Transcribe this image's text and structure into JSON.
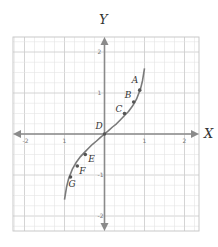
{
  "chart_data": {
    "type": "line",
    "title": "",
    "xlabel": "X",
    "ylabel": "Y",
    "xlim": [
      -2.3,
      2.3
    ],
    "ylim": [
      -2.4,
      2.4
    ],
    "grid": true,
    "grid_minor_step": 0.25,
    "x_ticks": [
      -2,
      -1,
      1,
      2
    ],
    "x_tick_labels": [
      "-2",
      "1",
      "1",
      "2"
    ],
    "y_ticks": [
      2,
      1,
      -1,
      -2
    ],
    "y_tick_labels": [
      "2",
      "1",
      "-1",
      "-2"
    ],
    "curve": {
      "description": "S-shaped increasing curve through origin",
      "x": [
        -1.0,
        -0.95,
        -0.9,
        -0.8,
        -0.7,
        -0.6,
        -0.5,
        -0.4,
        -0.3,
        -0.2,
        -0.1,
        0,
        0.1,
        0.2,
        0.3,
        0.4,
        0.5,
        0.6,
        0.7,
        0.8,
        0.9,
        0.95,
        1.0
      ],
      "y": [
        -1.6,
        -1.3,
        -1.1,
        -0.85,
        -0.68,
        -0.55,
        -0.45,
        -0.35,
        -0.25,
        -0.17,
        -0.08,
        0,
        0.08,
        0.17,
        0.25,
        0.35,
        0.45,
        0.55,
        0.68,
        0.85,
        1.1,
        1.3,
        1.6
      ]
    },
    "points": [
      {
        "label": "A",
        "x": 0.88,
        "y": 1.07
      },
      {
        "label": "B",
        "x": 0.73,
        "y": 0.78
      },
      {
        "label": "C",
        "x": 0.5,
        "y": 0.5
      },
      {
        "label": "D",
        "x": 0.0,
        "y": 0.0
      },
      {
        "label": "E",
        "x": -0.48,
        "y": -0.5
      },
      {
        "label": "F",
        "x": -0.68,
        "y": -0.78
      },
      {
        "label": "G",
        "x": -0.85,
        "y": -1.05
      }
    ]
  },
  "colors": {
    "axis": "#8a8a8a",
    "curve": "#7a7a7a",
    "grid_minor": "#e4e4e4",
    "grid_major": "#cfcfcf",
    "point": "#555555"
  }
}
